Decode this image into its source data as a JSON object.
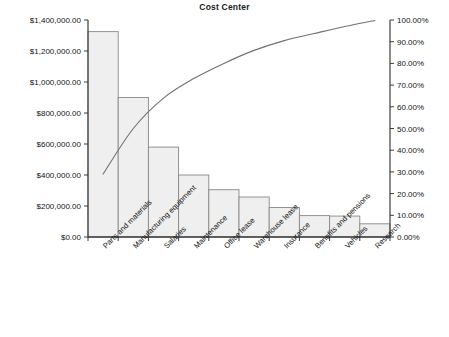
{
  "chart_data": {
    "type": "bar",
    "title": "Cost Center",
    "xlabel": "",
    "ylabel": "",
    "categories": [
      "Parts and materials",
      "Manufacturing equipment",
      "Salaries",
      "Maintenance",
      "Office lease",
      "Warehouse lease",
      "Insurance",
      "Benefits and pensions",
      "Vehicles",
      "Research"
    ],
    "series": [
      {
        "name": "Cost",
        "axis": "left",
        "type": "bar",
        "values": [
          1325000,
          900000,
          580000,
          400000,
          305000,
          258000,
          190000,
          138000,
          135000,
          85000
        ]
      },
      {
        "name": "Cumulative percentage",
        "axis": "right",
        "type": "line",
        "values": [
          29.0,
          50.0,
          64.0,
          73.0,
          80.0,
          86.0,
          90.5,
          93.8,
          97.0,
          99.8
        ]
      }
    ],
    "ylim": [
      0,
      1400000
    ],
    "y2lim": [
      0,
      100
    ],
    "ytick_labels": [
      "$0.00",
      "$200,000.00",
      "$400,000.00",
      "$600,000.00",
      "$800,000.00",
      "$1,000,000.00",
      "$1,200,000.00",
      "$1,400,000.00"
    ],
    "ytick_values": [
      0,
      200000,
      400000,
      600000,
      800000,
      1000000,
      1200000,
      1400000
    ],
    "y2tick_labels": [
      "0.00%",
      "10.00%",
      "20.00%",
      "30.00%",
      "40.00%",
      "50.00%",
      "60.00%",
      "70.00%",
      "80.00%",
      "90.00%",
      "100.00%"
    ],
    "y2tick_values": [
      0,
      10,
      20,
      30,
      40,
      50,
      60,
      70,
      80,
      90,
      100
    ],
    "grid": false,
    "legend": "none",
    "colors": {
      "bar_fill": "#efefef",
      "bar_stroke": "#888888",
      "line": "#707070",
      "axis": "#3c3c3c",
      "text": "#141414",
      "background": "#ffffff"
    }
  }
}
